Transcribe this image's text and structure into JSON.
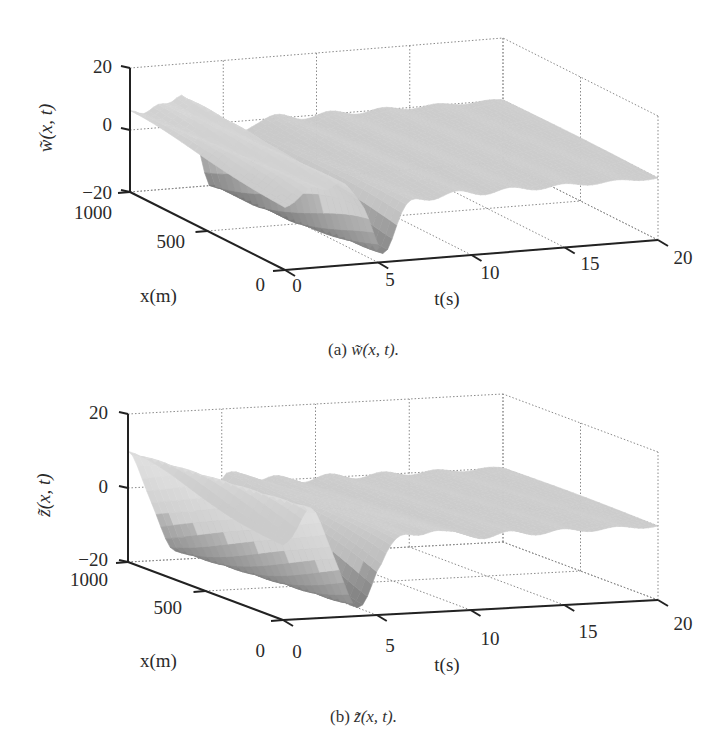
{
  "chart_data": [
    {
      "type": "surface3d",
      "id": "w",
      "caption_prefix": "(a)",
      "caption_func": "w̃(x, t).",
      "zlabel": "w̃(x, t)",
      "xlabel": "x(m)",
      "tlabel": "t(s)",
      "z_ticks": [
        "20",
        "0",
        "−20"
      ],
      "x_ticks": [
        "1000",
        "500",
        "0"
      ],
      "t_ticks": [
        "0",
        "5",
        "10",
        "15",
        "20"
      ],
      "zlim": [
        -20,
        20
      ],
      "xlim": [
        0,
        1000
      ],
      "tlim": [
        0,
        20
      ],
      "grid": true,
      "surface": {
        "description": "Travelling wave ridges decaying after ~t=6 s; deep trough near t=4-5 s at x=0",
        "baseline": 0,
        "features": [
          {
            "kind": "ridge",
            "t_at_x1000": 0.0,
            "t_at_x0": 1.5,
            "amplitude": 6
          },
          {
            "kind": "ridge",
            "t_at_x1000": 1.5,
            "t_at_x0": 3.0,
            "amplitude": 7
          },
          {
            "kind": "ridge",
            "t_at_x1000": 3.0,
            "t_at_x0": 4.5,
            "amplitude": 12
          },
          {
            "kind": "trough",
            "t_at_x1000": 4.5,
            "t_at_x0": 5.0,
            "amplitude": -22
          }
        ],
        "residual_ripple_amplitude": 1.5,
        "t_extent": [
          0,
          20
        ]
      }
    },
    {
      "type": "surface3d",
      "id": "z",
      "caption_prefix": "(b)",
      "caption_func": "z̃(x, t).",
      "zlabel": "z̃(x, t)",
      "xlabel": "x(m)",
      "tlabel": "t(s)",
      "z_ticks": [
        "20",
        "0",
        "−20"
      ],
      "x_ticks": [
        "1000",
        "500",
        "0"
      ],
      "t_ticks": [
        "0",
        "5",
        "10",
        "15",
        "20"
      ],
      "zlim": [
        -20,
        20
      ],
      "xlim": [
        0,
        1000
      ],
      "tlim": [
        0,
        20
      ],
      "grid": true,
      "surface": {
        "description": "Large positive hump at t=0 (~+10) sloping to trough (~-18) near t=3-4 s, then small oscillations decaying by t=20",
        "baseline": 0,
        "features": [
          {
            "kind": "ridge",
            "t_at_x1000": 0.0,
            "t_at_x0": 1.5,
            "amplitude": 10
          },
          {
            "kind": "trough",
            "t_at_x1000": 2.5,
            "t_at_x0": 4.0,
            "amplitude": -18
          },
          {
            "kind": "ripple",
            "t_at_x1000": 6.0,
            "t_at_x0": 8.0,
            "amplitude": 3
          }
        ],
        "residual_ripple_amplitude": 1.5,
        "t_extent": [
          0,
          20
        ]
      }
    }
  ]
}
